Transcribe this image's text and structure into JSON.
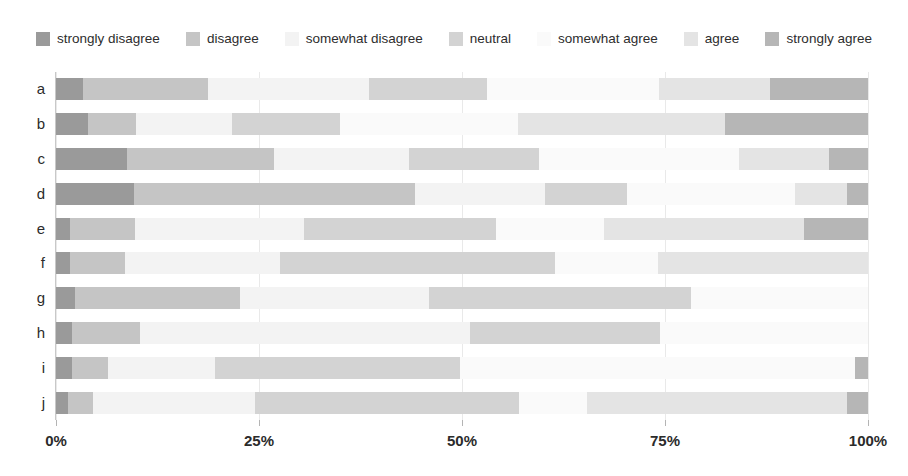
{
  "chart_data": {
    "type": "bar",
    "subtype": "stacked-horizontal-likert",
    "title": "",
    "subtitle": "",
    "xlabel": "",
    "ylabel": "",
    "xlim": [
      0,
      100
    ],
    "x_tick_labels": [
      "0%",
      "25%",
      "50%",
      "75%",
      "100%"
    ],
    "x_tick_values": [
      0,
      25,
      50,
      75,
      100
    ],
    "grid": true,
    "legend_position": "top",
    "orientation": "horizontal",
    "stacked": true,
    "units": "percent",
    "categories": [
      "a",
      "b",
      "c",
      "d",
      "e",
      "f",
      "g",
      "h",
      "i",
      "j"
    ],
    "legend_entries": [
      "strongly disagree",
      "disagree",
      "somewhat disagree",
      "neutral",
      "somewhat agree",
      "agree",
      "strongly agree"
    ],
    "colors": [
      "#9a9a9a",
      "#c5c5c5",
      "#f3f3f3",
      "#d3d3d3",
      "#fafafa",
      "#e4e4e4",
      "#b6b6b6"
    ],
    "series": [
      {
        "name": "strongly disagree",
        "color": "#9a9a9a",
        "values": [
          3.3,
          4.0,
          8.7,
          9.6,
          1.7,
          1.7,
          2.3,
          2.0,
          2.0,
          1.5
        ]
      },
      {
        "name": "disagree",
        "color": "#c5c5c5",
        "values": [
          15.4,
          5.9,
          18.2,
          34.6,
          8.0,
          6.8,
          20.4,
          8.4,
          4.4,
          3.0
        ]
      },
      {
        "name": "somewhat disagree",
        "color": "#f3f3f3",
        "values": [
          19.9,
          11.8,
          16.6,
          16.0,
          20.9,
          19.1,
          23.2,
          40.6,
          13.2,
          20.0
        ]
      },
      {
        "name": "neutral",
        "color": "#d3d3d3",
        "values": [
          14.5,
          13.3,
          16.0,
          10.1,
          23.6,
          33.9,
          32.3,
          23.4,
          30.2,
          32.5
        ]
      },
      {
        "name": "somewhat agree",
        "color": "#fafafa",
        "values": [
          21.2,
          21.9,
          24.6,
          20.7,
          13.3,
          12.6,
          21.8,
          25.6,
          48.6,
          8.4
        ]
      },
      {
        "name": "agree",
        "color": "#e4e4e4",
        "values": [
          13.6,
          25.5,
          11.1,
          6.4,
          24.6,
          25.9,
          0.0,
          0.0,
          0.0,
          32.0
        ]
      },
      {
        "name": "strongly agree",
        "color": "#b6b6b6",
        "values": [
          12.1,
          17.6,
          4.8,
          2.6,
          7.9,
          0.0,
          0.0,
          0.0,
          1.6,
          2.6
        ]
      }
    ],
    "rows": [
      {
        "label": "a",
        "values": [
          3.3,
          15.4,
          19.9,
          14.5,
          21.2,
          13.6,
          12.1
        ]
      },
      {
        "label": "b",
        "values": [
          4.0,
          5.9,
          11.8,
          13.3,
          21.9,
          25.5,
          17.6
        ]
      },
      {
        "label": "c",
        "values": [
          8.7,
          18.2,
          16.6,
          16.0,
          24.6,
          11.1,
          4.8
        ]
      },
      {
        "label": "d",
        "values": [
          9.6,
          34.6,
          16.0,
          10.1,
          20.7,
          6.4,
          2.6
        ]
      },
      {
        "label": "e",
        "values": [
          1.7,
          8.0,
          20.9,
          23.6,
          13.3,
          24.6,
          7.9
        ]
      },
      {
        "label": "f",
        "values": [
          1.7,
          6.8,
          19.1,
          33.9,
          12.6,
          25.9,
          0.0
        ]
      },
      {
        "label": "g",
        "values": [
          2.3,
          20.4,
          23.2,
          32.3,
          21.8,
          0.0,
          0.0
        ]
      },
      {
        "label": "h",
        "values": [
          2.0,
          8.4,
          40.6,
          23.4,
          25.6,
          0.0,
          0.0
        ]
      },
      {
        "label": "i",
        "values": [
          2.0,
          4.4,
          13.2,
          30.2,
          48.6,
          0.0,
          1.6
        ]
      },
      {
        "label": "j",
        "values": [
          1.5,
          3.0,
          20.0,
          32.5,
          8.4,
          32.0,
          2.6
        ]
      }
    ]
  }
}
